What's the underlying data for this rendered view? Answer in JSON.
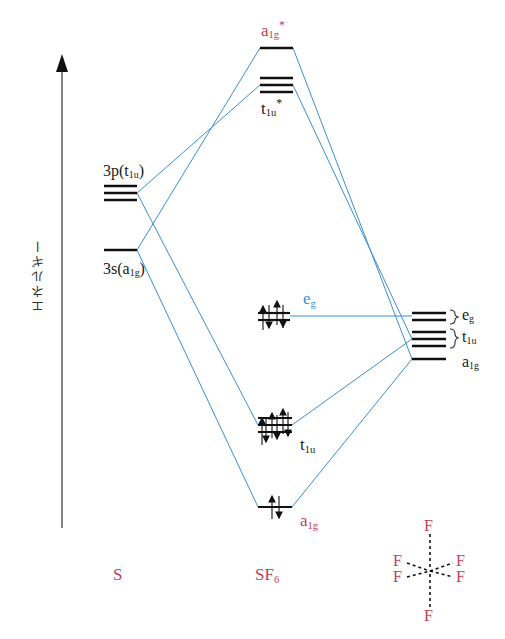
{
  "axis": {
    "label": "エネルギー",
    "direction": "up"
  },
  "columns": {
    "S": {
      "title": "S"
    },
    "SF6": {
      "title_main": "SF",
      "title_sub": "6"
    },
    "F6": {
      "title": "F"
    }
  },
  "S_levels": {
    "p": {
      "main": "3p",
      "sym": "t",
      "sym_sub": "1u",
      "degeneracy": 3
    },
    "s": {
      "main": "3s",
      "sym": "a",
      "sym_sub": "1g",
      "degeneracy": 1
    }
  },
  "SF6_levels": {
    "a1g_star": {
      "sym": "a",
      "sub": "1g",
      "star": "*",
      "color": "#c0405a",
      "degeneracy": 1,
      "electrons": 0
    },
    "t1u_star": {
      "sym": "t",
      "sub": "1u",
      "star": "*",
      "color": "#1a1a1a",
      "degeneracy": 3,
      "electrons": 0
    },
    "eg": {
      "sym": "e",
      "sub": "g",
      "color": "#3a8fd0",
      "degeneracy": 2,
      "electrons": 4
    },
    "t1u": {
      "sym": "t",
      "sub": "1u",
      "color": "#1a1a1a",
      "degeneracy": 3,
      "electrons": 6
    },
    "a1g": {
      "sym": "a",
      "sub": "1g",
      "color": "#c0405a",
      "degeneracy": 1,
      "electrons": 2
    }
  },
  "F6_levels": {
    "eg": {
      "sym": "e",
      "sub": "g",
      "degeneracy": 2
    },
    "t1u": {
      "sym": "t",
      "sub": "1u",
      "degeneracy": 3
    },
    "a1g": {
      "sym": "a",
      "sub": "1g",
      "degeneracy": 1
    }
  },
  "F6_structure": {
    "atoms": [
      "F",
      "F",
      "F",
      "F",
      "F",
      "F"
    ]
  },
  "colors": {
    "level": "#1a1a1a",
    "correlation_line": "#3a8fd0",
    "label_red": "#c0405a"
  }
}
